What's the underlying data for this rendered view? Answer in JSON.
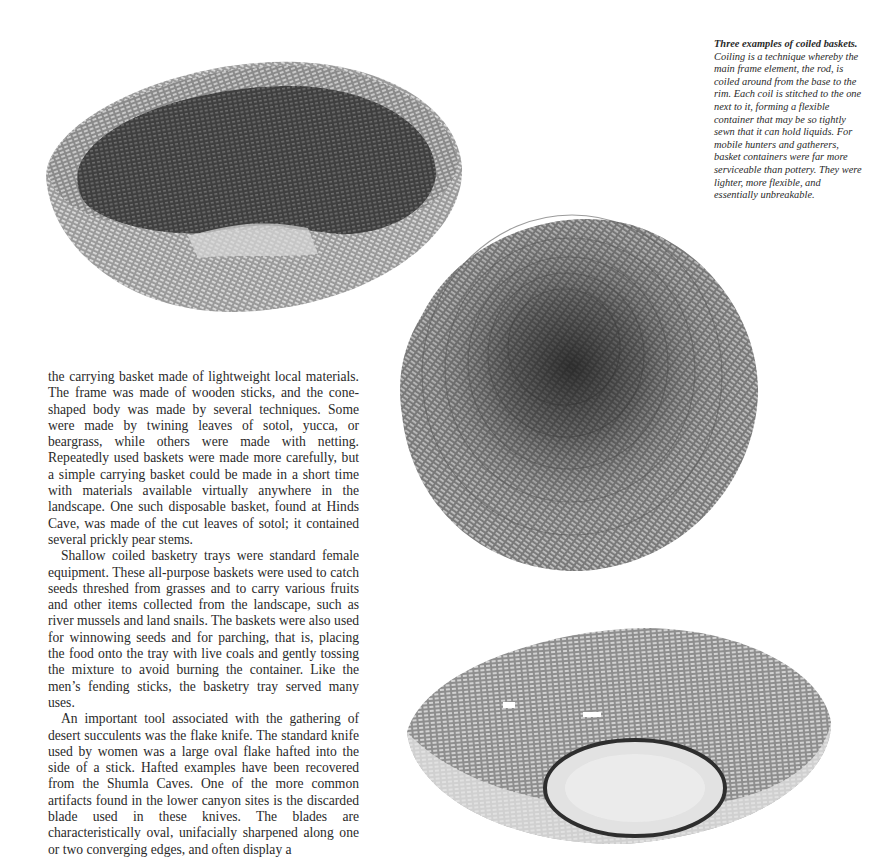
{
  "figures": [
    {
      "id": "basket-top",
      "description": "Coiled basket, deep bowl viewed from side with broken rim"
    },
    {
      "id": "basket-mid",
      "description": "Coiled basket viewed from above showing spiral coils"
    },
    {
      "id": "basket-bottom",
      "description": "Shallow coiled basketry tray with round base"
    }
  ],
  "caption": {
    "lead": "Three examples of coiled baskets.",
    "text": " Coiling is a technique whereby the main frame element, the rod, is coiled around from the base to the rim. Each coil is stitched to the one next to it, forming a flexible container that may be so tightly sewn that it can hold liquids. For mobile hunters and gatherers, basket containers were far more serviceable than pottery. They were lighter, more flexible, and essentially unbreakable."
  },
  "body": {
    "paragraphs": [
      "the carrying basket made of lightweight local materials. The frame was made of wooden sticks, and the cone-shaped body was made by several techniques. Some were made by twining leaves of sotol, yucca, or beargrass, while others were made with netting. Repeatedly used baskets were made more carefully, but a simple carrying basket could be made in a short time with materials available virtually anywhere in the landscape. One such disposable basket, found at Hinds Cave, was made of the cut leaves of sotol; it contained several prickly pear stems.",
      "Shallow coiled basketry trays were standard female equipment. These all-purpose baskets were used to catch seeds threshed from grasses and to carry various fruits and other items collected from the landscape, such as river mussels and land snails. The baskets were also used for winnowing seeds and for parching, that is, placing the food onto the tray with live coals and gently tossing the mixture to avoid burning the container. Like the men’s fending sticks, the basketry tray served many uses.",
      "An important tool associated with the gathering of desert succulents was the flake knife. The standard knife used by women was a large oval flake hafted into the side of a stick. Hafted examples have been recovered from the Shumla Caves. One of the more common artifacts found in the lower canyon sites is the discarded blade used in these knives. The blades are characteristically oval, unifacially sharpened along one or two converging edges, and often display a"
    ]
  }
}
